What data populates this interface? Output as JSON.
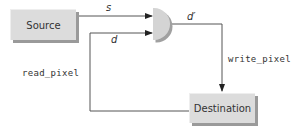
{
  "diagram": {
    "nodes": {
      "source": {
        "label": "Source"
      },
      "destination": {
        "label": "Destination"
      },
      "combiner": {
        "shape": "half-circle gate"
      }
    },
    "edges": {
      "s": {
        "label": "s",
        "from": "Source",
        "to": "gate"
      },
      "d": {
        "label": "d",
        "from": "Destination",
        "to": "gate"
      },
      "d_prime": {
        "label": "d′",
        "from": "gate",
        "to": "Destination"
      },
      "read_pixel": {
        "label": "read_pixel"
      },
      "write_pixel": {
        "label": "write_pixel"
      }
    }
  },
  "colors": {
    "box_fill": "#dcdcdc",
    "box_shadow": "#9a9a9a",
    "line": "#555555",
    "gate_fill": "#d4d4d4",
    "gate_shadow": "#a0a0a0"
  }
}
